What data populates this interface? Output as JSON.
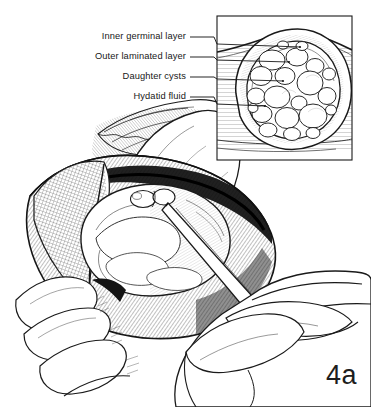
{
  "figure": {
    "number": "4a",
    "background_color": "#ffffff",
    "ink_color": "#1a1a1a"
  },
  "callouts": [
    {
      "id": "inner-germinal-layer",
      "label": "Inner germinal layer",
      "text_right_x": 186,
      "text_y": 37,
      "leader_to_x": 300,
      "leader_to_y": 47
    },
    {
      "id": "outer-laminated-layer",
      "label": "Outer laminated layer",
      "text_right_x": 186,
      "text_y": 57,
      "leader_to_x": 289,
      "leader_to_y": 62
    },
    {
      "id": "daughter-cysts",
      "label": "Daughter cysts",
      "text_right_x": 186,
      "text_y": 77,
      "leader_to_x": 283,
      "leader_to_y": 81
    },
    {
      "id": "hydatid-fluid",
      "label": "Hydatid fluid",
      "text_right_x": 186,
      "text_y": 97,
      "leader_to_x": 265,
      "leader_to_y": 106
    }
  ],
  "inset": {
    "name": "cyst-cross-section",
    "frame": {
      "x": 217,
      "y": 16,
      "width": 135,
      "height": 144
    },
    "description": "cross-section of hydatid cyst showing daughter cysts within laminated wall"
  },
  "main_scene": {
    "name": "operative-field",
    "elements": [
      "retracted-tissue-flap",
      "exposed-cyst-dome",
      "surgeon-hand",
      "trocar-instrument",
      "fingers"
    ]
  }
}
